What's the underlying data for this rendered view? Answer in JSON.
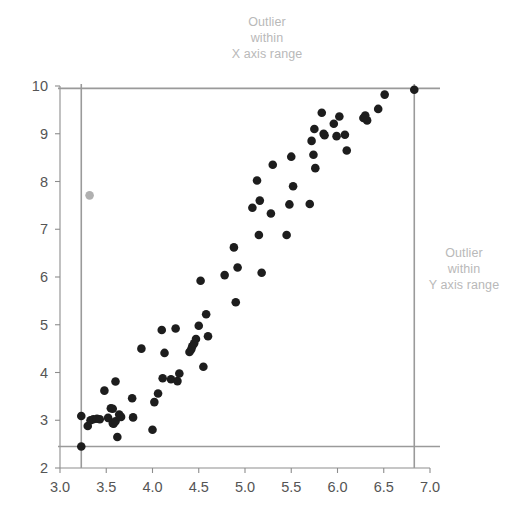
{
  "annotations": {
    "top": {
      "name": "outlier-within-x-axis-range",
      "line1": "Outlier",
      "line2": "within",
      "line3": "X axis range"
    },
    "right": {
      "name": "outlier-within-y-axis-range",
      "line1": "Outlier",
      "line2": "within",
      "line3": "Y axis range"
    }
  },
  "colors": {
    "point": "#1d1d1d",
    "outlier_point": "#b0b0b0",
    "axis": "#8d8d8d",
    "reference_line": "#9a9a9a",
    "tick_text": "#555555",
    "annotation_text": "#b9b9b9",
    "background": "#ffffff"
  },
  "chart_data": {
    "type": "scatter",
    "title": "",
    "subtitle": "",
    "xlabel": "",
    "ylabel": "",
    "xlim": [
      3.0,
      7.0
    ],
    "ylim": [
      2,
      10
    ],
    "grid": false,
    "legend": null,
    "xticks": [
      3.0,
      3.5,
      4.0,
      4.5,
      5.0,
      5.5,
      6.0,
      6.5,
      7.0
    ],
    "xtick_labels": [
      "3.0",
      "3.5",
      "4.0",
      "4.5",
      "5.0",
      "5.5",
      "6.0",
      "6.5",
      "7.0"
    ],
    "yticks": [
      2,
      3,
      4,
      5,
      6,
      7,
      8,
      9,
      10
    ],
    "ytick_labels": [
      "2",
      "3",
      "4",
      "5",
      "6",
      "7",
      "8",
      "9",
      "10"
    ],
    "reference_lines": [
      {
        "name": "min-x-reference",
        "orientation": "vertical",
        "value": 3.23
      },
      {
        "name": "max-x-reference",
        "orientation": "vertical",
        "value": 6.83
      },
      {
        "name": "min-y-reference",
        "orientation": "horizontal",
        "value": 2.45
      },
      {
        "name": "max-y-reference",
        "orientation": "horizontal",
        "value": 9.95
      }
    ],
    "series": [
      {
        "name": "data",
        "color": "#1d1d1d",
        "marker": "circle",
        "points": [
          [
            3.23,
            3.09
          ],
          [
            3.23,
            2.45
          ],
          [
            3.3,
            2.88
          ],
          [
            3.33,
            3.0
          ],
          [
            3.36,
            3.02
          ],
          [
            3.4,
            3.03
          ],
          [
            3.43,
            3.02
          ],
          [
            3.48,
            3.62
          ],
          [
            3.52,
            3.05
          ],
          [
            3.55,
            3.25
          ],
          [
            3.57,
            3.24
          ],
          [
            3.57,
            2.94
          ],
          [
            3.58,
            2.93
          ],
          [
            3.6,
            3.81
          ],
          [
            3.6,
            2.98
          ],
          [
            3.62,
            2.65
          ],
          [
            3.64,
            3.12
          ],
          [
            3.66,
            3.07
          ],
          [
            3.78,
            3.46
          ],
          [
            3.79,
            3.06
          ],
          [
            3.88,
            4.5
          ],
          [
            4.0,
            2.8
          ],
          [
            4.02,
            3.38
          ],
          [
            4.06,
            3.56
          ],
          [
            4.1,
            4.89
          ],
          [
            4.11,
            3.88
          ],
          [
            4.13,
            4.41
          ],
          [
            4.2,
            3.86
          ],
          [
            4.25,
            4.92
          ],
          [
            4.27,
            3.82
          ],
          [
            4.29,
            3.98
          ],
          [
            4.4,
            4.43
          ],
          [
            4.42,
            4.49
          ],
          [
            4.43,
            4.55
          ],
          [
            4.45,
            4.61
          ],
          [
            4.47,
            4.7
          ],
          [
            4.5,
            4.98
          ],
          [
            4.52,
            5.92
          ],
          [
            4.55,
            4.12
          ],
          [
            4.58,
            5.22
          ],
          [
            4.6,
            4.76
          ],
          [
            4.78,
            6.04
          ],
          [
            4.88,
            6.62
          ],
          [
            4.9,
            5.47
          ],
          [
            4.92,
            6.2
          ],
          [
            5.08,
            7.45
          ],
          [
            5.13,
            8.02
          ],
          [
            5.15,
            6.88
          ],
          [
            5.16,
            7.6
          ],
          [
            5.18,
            6.09
          ],
          [
            5.28,
            7.33
          ],
          [
            5.3,
            8.35
          ],
          [
            5.45,
            6.88
          ],
          [
            5.48,
            7.52
          ],
          [
            5.5,
            8.52
          ],
          [
            5.52,
            7.9
          ],
          [
            5.7,
            7.53
          ],
          [
            5.72,
            8.85
          ],
          [
            5.74,
            8.56
          ],
          [
            5.75,
            9.1
          ],
          [
            5.76,
            8.28
          ],
          [
            5.83,
            9.44
          ],
          [
            5.85,
            9.0
          ],
          [
            5.86,
            8.97
          ],
          [
            5.96,
            9.21
          ],
          [
            5.99,
            8.95
          ],
          [
            6.02,
            9.36
          ],
          [
            6.08,
            8.98
          ],
          [
            6.1,
            8.65
          ],
          [
            6.28,
            9.33
          ],
          [
            6.3,
            9.38
          ],
          [
            6.32,
            9.28
          ],
          [
            6.44,
            9.52
          ],
          [
            6.51,
            9.82
          ],
          [
            6.83,
            9.92
          ]
        ]
      },
      {
        "name": "outlier",
        "color": "#b0b0b0",
        "marker": "circle",
        "points": [
          [
            3.32,
            7.71
          ]
        ]
      }
    ]
  }
}
